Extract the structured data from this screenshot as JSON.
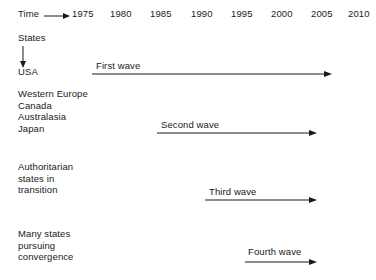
{
  "figure": {
    "axis": {
      "time_label": "Time",
      "time_arrow_icon": "arrow-right-icon",
      "years": [
        "1975",
        "1980",
        "1985",
        "1990",
        "1995",
        "2000",
        "2005",
        "2010"
      ]
    },
    "states_axis": {
      "label": "States",
      "arrow_icon": "arrow-down-icon"
    },
    "rows": [
      {
        "group_lines": [
          "USA"
        ],
        "wave_label": "First wave",
        "arrow_icon": "arrow-right-icon"
      },
      {
        "group_lines": [
          "Western Europe",
          "Canada",
          "Australasia",
          "Japan"
        ],
        "wave_label": "Second wave",
        "arrow_icon": "arrow-right-icon"
      },
      {
        "group_lines": [
          "Authoritarian",
          "states in",
          "transition"
        ],
        "wave_label": "Third wave",
        "arrow_icon": "arrow-right-icon"
      },
      {
        "group_lines": [
          "Many states",
          "pursuing",
          "convergence"
        ],
        "wave_label": "Fourth wave",
        "arrow_icon": "arrow-right-icon"
      }
    ],
    "colors": {
      "ink": "#1a1a1a",
      "background": "#ffffff"
    }
  }
}
